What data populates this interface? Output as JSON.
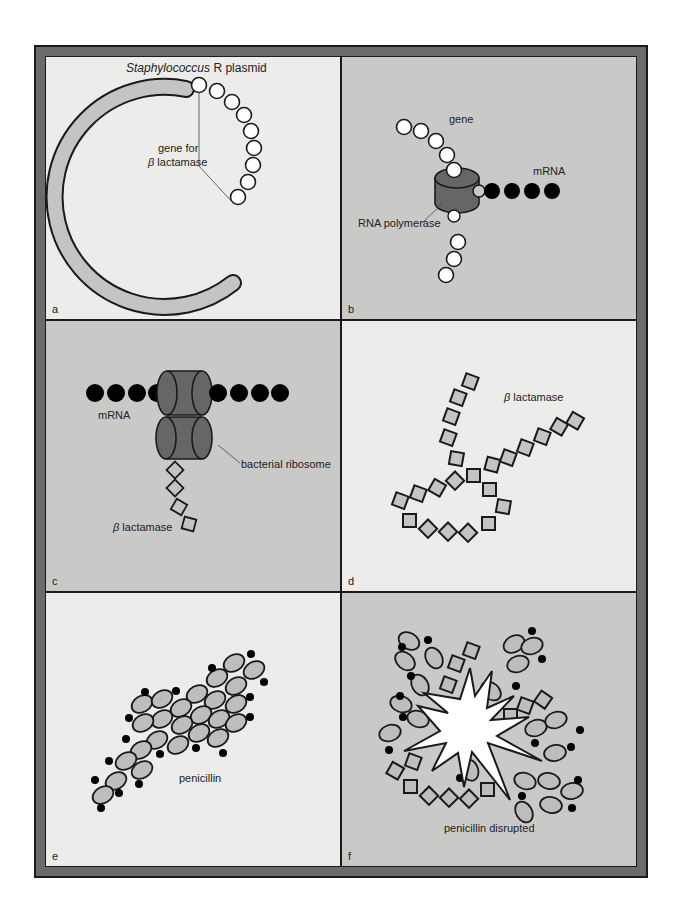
{
  "figure": {
    "colors": {
      "frame": "#6b6b6b",
      "frame_border": "#1a1a1a",
      "panel_light": "#ececeb",
      "panel_dark": "#c9c9c8",
      "plasmid_arc": "#c4c4c4",
      "enzyme_fill": "#666666",
      "subunit_fill": "#bdbdbd",
      "mrna_fill": "#000000",
      "gene_fill": "#ffffff"
    },
    "panels": [
      {
        "id": "a",
        "letter": "a",
        "title_italic": "Staphylococcus",
        "title_rest": " R plasmid",
        "label_line1": "gene for",
        "label_beta": "β",
        "label_line2": " lactamase"
      },
      {
        "id": "b",
        "letter": "b",
        "label_gene": "gene",
        "label_mrna": "mRNA",
        "label_polymerase": "RNA polymerase"
      },
      {
        "id": "c",
        "letter": "c",
        "label_mrna": "mRNA",
        "label_ribosome": "bacterial ribosome",
        "label_beta": "β",
        "label_lactamase": " lactamase"
      },
      {
        "id": "d",
        "letter": "d",
        "label_beta": "β",
        "label_lactamase": " lactamase"
      },
      {
        "id": "e",
        "letter": "e",
        "label_penicillin": "penicillin"
      },
      {
        "id": "f",
        "letter": "f",
        "label_disrupted": "penicillin disrupted"
      }
    ]
  }
}
